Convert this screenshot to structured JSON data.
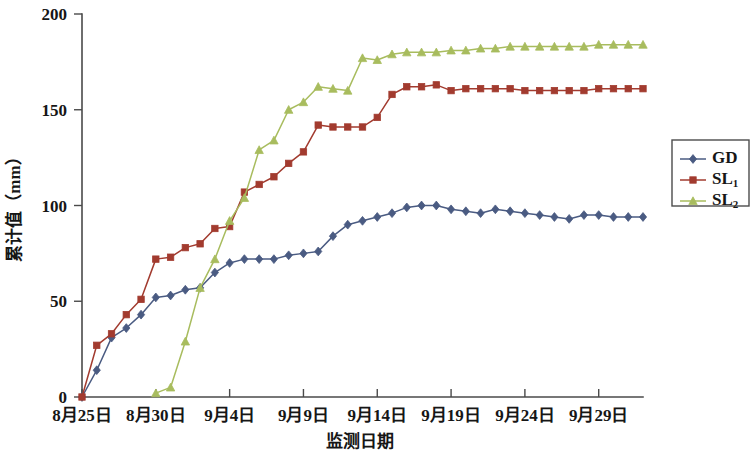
{
  "chart_data": {
    "type": "line",
    "title": "",
    "xlabel": "监测日期",
    "ylabel": "累计值（mm）",
    "ylim": [
      0,
      200
    ],
    "yticks": [
      0,
      50,
      100,
      150,
      200
    ],
    "ytick_labels": [
      "0",
      "50",
      "100",
      "150",
      "200"
    ],
    "grid": false,
    "legend_position": "right",
    "x_start_label": "8月25日",
    "xtick_labels": [
      "8月25日",
      "8月30日",
      "9月4日",
      "9月9日",
      "9月14日",
      "9月19日",
      "9月24日",
      "9月29日"
    ],
    "xtick_days": [
      0,
      5,
      10,
      15,
      20,
      25,
      30,
      35
    ],
    "xlim_days": [
      0,
      38
    ],
    "colors": {
      "GD": "#4a5b82",
      "SL1": "#a23b2f",
      "SL2": "#a8bc5e"
    },
    "markers": {
      "GD": "diamond",
      "SL1": "square",
      "SL2": "triangle"
    },
    "series": [
      {
        "name": "GD",
        "label": "GD",
        "label_main": "GD",
        "label_sub": "",
        "color": "#4a5b82",
        "marker": "diamond",
        "x": [
          0,
          1,
          2,
          3,
          4,
          5,
          6,
          7,
          8,
          9,
          10,
          11,
          12,
          13,
          14,
          15,
          16,
          17,
          18,
          19,
          20,
          21,
          22,
          23,
          24,
          25,
          26,
          27,
          28,
          29,
          30,
          31,
          32,
          33,
          34,
          35,
          36,
          37,
          38
        ],
        "values": [
          0,
          14,
          31,
          36,
          43,
          52,
          53,
          56,
          57,
          65,
          70,
          72,
          72,
          72,
          74,
          75,
          76,
          84,
          90,
          92,
          94,
          96,
          99,
          100,
          100,
          98,
          97,
          96,
          98,
          97,
          96,
          95,
          94,
          93,
          95,
          95,
          94,
          94,
          94
        ]
      },
      {
        "name": "SL1",
        "label": "SL1",
        "label_main": "SL",
        "label_sub": "1",
        "color": "#a23b2f",
        "marker": "square",
        "x": [
          0,
          1,
          2,
          3,
          4,
          5,
          6,
          7,
          8,
          9,
          10,
          11,
          12,
          13,
          14,
          15,
          16,
          17,
          18,
          19,
          20,
          21,
          22,
          23,
          24,
          25,
          26,
          27,
          28,
          29,
          30,
          31,
          32,
          33,
          34,
          35,
          36,
          37,
          38
        ],
        "values": [
          0,
          27,
          33,
          43,
          51,
          72,
          73,
          78,
          80,
          88,
          89,
          107,
          111,
          115,
          122,
          128,
          142,
          141,
          141,
          141,
          146,
          158,
          162,
          162,
          163,
          160,
          161,
          161,
          161,
          161,
          160,
          160,
          160,
          160,
          160,
          161,
          161,
          161,
          161
        ]
      },
      {
        "name": "SL2",
        "label": "SL2",
        "label_main": "SL",
        "label_sub": "2",
        "color": "#a8bc5e",
        "marker": "triangle",
        "x": [
          5,
          6,
          7,
          8,
          9,
          10,
          11,
          12,
          13,
          14,
          15,
          16,
          17,
          18,
          19,
          20,
          21,
          22,
          23,
          24,
          25,
          26,
          27,
          28,
          29,
          30,
          31,
          32,
          33,
          34,
          35,
          36,
          37,
          38
        ],
        "values": [
          2,
          5,
          29,
          57,
          72,
          92,
          104,
          129,
          134,
          150,
          154,
          162,
          161,
          160,
          177,
          176,
          179,
          180,
          180,
          180,
          181,
          181,
          182,
          182,
          183,
          183,
          183,
          183,
          183,
          183,
          184,
          184,
          184,
          184
        ]
      }
    ]
  },
  "legend": {
    "items": [
      {
        "label_main": "GD",
        "label_sub": "",
        "color": "#4a5b82",
        "marker": "diamond"
      },
      {
        "label_main": "SL",
        "label_sub": "1",
        "color": "#a23b2f",
        "marker": "square"
      },
      {
        "label_main": "SL",
        "label_sub": "2",
        "color": "#a8bc5e",
        "marker": "triangle"
      }
    ]
  }
}
